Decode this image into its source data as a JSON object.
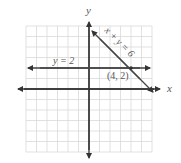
{
  "diagram": {
    "axes": {
      "x_label": "x",
      "y_label": "y",
      "range": [
        -6,
        6
      ]
    },
    "lines": [
      {
        "equation": "y = 2",
        "label": "y = 2"
      },
      {
        "equation": "x + y = 6",
        "label": "x + y = 6"
      }
    ],
    "intersection": {
      "label": "(4, 2)",
      "x": 4,
      "y": 2
    },
    "colors": {
      "grid": "#d6d6d6",
      "axis": "#333333",
      "line": "#444444"
    }
  }
}
